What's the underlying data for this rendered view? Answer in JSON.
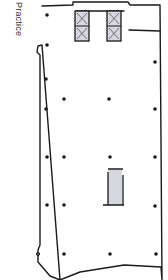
{
  "diagram": {
    "label": "Practice",
    "type": "floor-plan-sketch",
    "colors": {
      "line": "#1a1a1a",
      "core_fill": "#d6d6de",
      "background": "#ffffff"
    },
    "columns": [
      [
        47,
        15
      ],
      [
        47,
        45
      ],
      [
        46,
        79
      ],
      [
        64,
        99
      ],
      [
        109,
        99
      ],
      [
        46,
        109
      ],
      [
        155,
        62
      ],
      [
        155,
        109
      ],
      [
        47,
        157
      ],
      [
        64,
        157
      ],
      [
        110,
        157
      ],
      [
        155,
        157
      ],
      [
        47,
        205
      ],
      [
        64,
        205
      ],
      [
        155,
        206
      ],
      [
        64,
        254
      ],
      [
        110,
        254
      ],
      [
        156,
        254
      ]
    ]
  }
}
